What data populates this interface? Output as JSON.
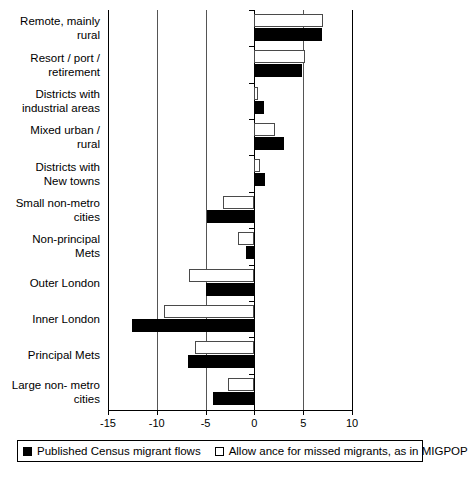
{
  "chart_data": {
    "type": "bar",
    "orientation": "horizontal",
    "title": "",
    "xlabel": "",
    "ylabel": "",
    "xlim": [
      -15,
      10
    ],
    "xticks": [
      -15,
      -10,
      -5,
      0,
      5,
      10
    ],
    "xticklabels": [
      "-15",
      "-10",
      "-5",
      "0",
      "5",
      "10"
    ],
    "grid": true,
    "legend_position": "bottom",
    "categories": [
      "Remote, mainly rural",
      "Resort / port / retirement",
      "Districts with industrial areas",
      "Mixed urban / rural",
      "Districts with New towns",
      "Small non-metro cities",
      "Non-principal Mets",
      "Outer London",
      "Inner London",
      "Principal Mets",
      "Large non-metro cities"
    ],
    "series": [
      {
        "name": "Published Census migrant flows",
        "style": "dark",
        "values": [
          6.9,
          4.9,
          1.0,
          3.0,
          1.1,
          -4.9,
          -0.9,
          -5.0,
          -12.5,
          -6.8,
          -4.2
        ]
      },
      {
        "name": "Allowance for  missed migrants, as in MIGPOP",
        "style": "light",
        "values": [
          7.0,
          5.2,
          0.4,
          2.1,
          0.6,
          -3.2,
          -1.7,
          -6.7,
          -9.3,
          -6.1,
          -2.7
        ]
      }
    ]
  },
  "category_labels": [
    [
      "Remote, mainly",
      "rural"
    ],
    [
      "Resort /  port /",
      "retirement"
    ],
    [
      "Districts with",
      "industrial areas"
    ],
    [
      "Mixed urban /",
      "rural"
    ],
    [
      "Districts with",
      "New towns"
    ],
    [
      "Small non-metro",
      "cities"
    ],
    [
      "Non-principal",
      "Mets"
    ],
    [
      "Outer London"
    ],
    [
      "Inner London"
    ],
    [
      "Principal Mets"
    ],
    [
      "Large non- metro",
      "cities"
    ]
  ],
  "legend": {
    "items": [
      {
        "label": "Published Census migrant flows",
        "style": "dark"
      },
      {
        "label": "Allow ance for  missed migrants, as in MIGPOP",
        "style": "light"
      }
    ]
  },
  "colors": {
    "dark": "#000000",
    "light": "#ffffff",
    "outline": "#4a4a4a",
    "axis": "#000000",
    "grid": "#555555",
    "background": "#ffffff"
  }
}
